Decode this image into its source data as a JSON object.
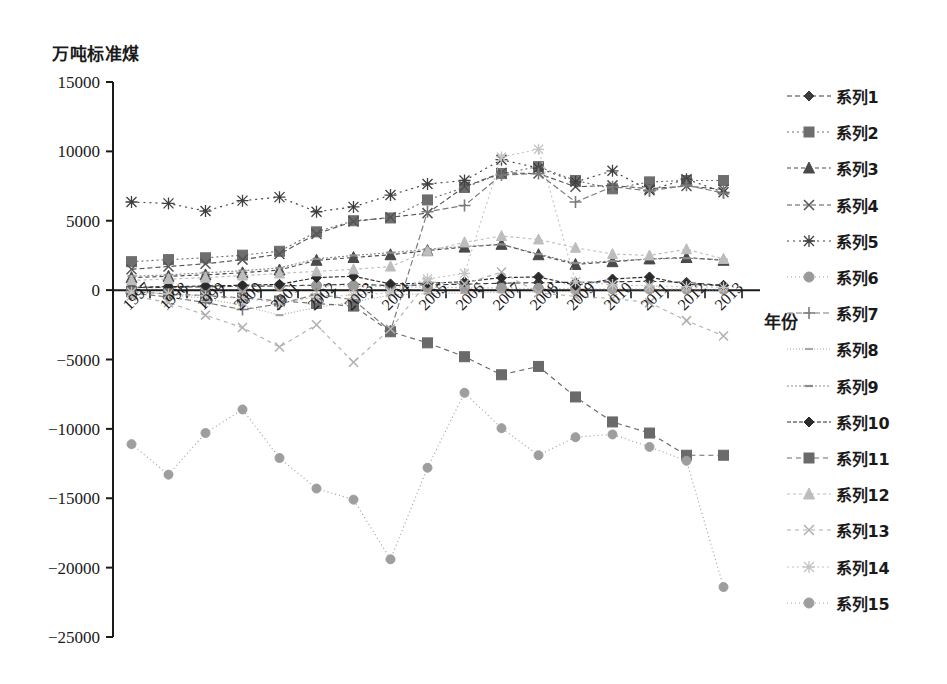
{
  "chart_data": {
    "type": "line",
    "title": "",
    "ylabel": "万吨标准煤",
    "xlabel": "年份",
    "ylim": [
      -25000,
      15000
    ],
    "ytick_step": 5000,
    "yticks": [
      "15000",
      "10000",
      "5000",
      "0",
      "-5000",
      "-10000",
      "-15000",
      "-20000",
      "-25000"
    ],
    "ytick_values": [
      15000,
      10000,
      5000,
      0,
      -5000,
      -10000,
      -15000,
      -20000,
      -25000
    ],
    "grid": false,
    "legend_position": "right",
    "categories": [
      "1997",
      "1998",
      "1999",
      "2000",
      "2001",
      "2002",
      "2003",
      "2004",
      "2005",
      "2006",
      "2007",
      "2008",
      "2009",
      "2010",
      "2011",
      "2012",
      "2013"
    ],
    "series": [
      {
        "name": "系列1",
        "marker": "diamond",
        "color": "#3c3c3c",
        "dash": "5,3",
        "values": [
          180,
          210,
          240,
          270,
          300,
          360,
          430,
          330,
          380,
          430,
          500,
          540,
          560,
          600,
          640,
          560,
          330
        ]
      },
      {
        "name": "系列2",
        "marker": "square",
        "color": "#6e6e6e",
        "dash": "2,3",
        "values": [
          2050,
          2200,
          2330,
          2520,
          2800,
          4200,
          5000,
          5200,
          6500,
          7400,
          8400,
          8900,
          7900,
          7300,
          7800,
          7900,
          7900
        ]
      },
      {
        "name": "系列3",
        "marker": "triangle",
        "color": "#4a4a4a",
        "dash": "4,3",
        "values": [
          900,
          1000,
          1100,
          1250,
          1450,
          2150,
          2350,
          2550,
          2850,
          3100,
          3300,
          2550,
          1850,
          2050,
          2250,
          2350,
          2150
        ]
      },
      {
        "name": "系列4",
        "marker": "x",
        "color": "#555555",
        "dash": "5,3",
        "values": [
          1500,
          1700,
          1900,
          2200,
          2600,
          4050,
          4950,
          5250,
          5550,
          7450,
          8450,
          8400,
          7450,
          7550,
          7300,
          7500,
          7250
        ]
      },
      {
        "name": "系列5",
        "marker": "asterisk",
        "color": "#404040",
        "dash": "2,4",
        "values": [
          6350,
          6250,
          5700,
          6450,
          6700,
          5650,
          6000,
          6850,
          7650,
          7900,
          9400,
          8800,
          7800,
          8600,
          7200,
          8000,
          7050
        ]
      },
      {
        "name": "系列6",
        "marker": "circle",
        "color": "#9a9a9a",
        "dash": "1,3",
        "values": [
          150,
          180,
          220,
          260,
          300,
          330,
          300,
          250,
          200,
          180,
          150,
          120,
          100,
          90,
          80,
          70,
          60
        ]
      },
      {
        "name": "系列7",
        "marker": "plus",
        "color": "#7a7a7a",
        "dash": "6,3",
        "values": [
          -200,
          -500,
          -900,
          -1400,
          -1000,
          -300,
          -700,
          -2950,
          5650,
          6100,
          8300,
          8400,
          6350,
          7450,
          7150,
          7550,
          7000
        ]
      },
      {
        "name": "系列8",
        "marker": "dash",
        "color": "#a8a8a8",
        "dash": "1,2",
        "values": [
          -100,
          -300,
          -600,
          -1100,
          -1800,
          -1250,
          -850,
          -350,
          -250,
          -200,
          -150,
          -120,
          -100,
          -90,
          -80,
          -70,
          -60
        ]
      },
      {
        "name": "系列9",
        "marker": "dash",
        "color": "#8a8a8a",
        "dash": "2,2",
        "values": [
          1000,
          1100,
          1250,
          1400,
          1600,
          2250,
          2500,
          2700,
          2950,
          3150,
          3300,
          2600,
          1950,
          2100,
          2250,
          2300,
          2200
        ]
      },
      {
        "name": "系列10",
        "marker": "diamond",
        "color": "#2b2b2b",
        "dash": "4,2",
        "values": [
          200,
          250,
          300,
          350,
          420,
          900,
          1000,
          450,
          500,
          600,
          900,
          950,
          350,
          800,
          950,
          400,
          350
        ]
      },
      {
        "name": "系列11",
        "marker": "square",
        "color": "#6a6a6a",
        "dash": "5,4",
        "values": [
          -120,
          -260,
          -400,
          -560,
          -780,
          -960,
          -1150,
          -3000,
          -3800,
          -4800,
          -6100,
          -5500,
          -7700,
          -9500,
          -10300,
          -11900,
          -11900
        ]
      },
      {
        "name": "系列12",
        "marker": "triangle",
        "color": "#bdbdbd",
        "dash": "3,3",
        "values": [
          700,
          800,
          900,
          1050,
          1200,
          1350,
          1500,
          1700,
          2800,
          3450,
          3900,
          3650,
          3050,
          2600,
          2500,
          2950,
          2250
        ]
      },
      {
        "name": "系列13",
        "marker": "x",
        "color": "#b0b0b0",
        "dash": "4,4",
        "values": [
          -400,
          -900,
          -1800,
          -2700,
          -4100,
          -2500,
          -5200,
          -2800,
          600,
          450,
          1300,
          -200,
          -450,
          -600,
          -900,
          -2200,
          -3300
        ]
      },
      {
        "name": "系列14",
        "marker": "asterisk",
        "color": "#c4c4c4",
        "dash": "2,3",
        "values": [
          -150,
          -280,
          -420,
          -600,
          -900,
          -500,
          -350,
          -200,
          800,
          1200,
          9600,
          10150,
          600,
          400,
          300,
          250,
          200
        ]
      },
      {
        "name": "系列15",
        "marker": "circle",
        "color": "#9e9e9e",
        "dash": "1,3",
        "values": [
          -11100,
          -13300,
          -10300,
          -8600,
          -12100,
          -14300,
          -15100,
          -19400,
          -12800,
          -7400,
          -9950,
          -11900,
          -10600,
          -10400,
          -11300,
          -12300,
          -21400
        ]
      }
    ]
  },
  "legend": {
    "items": [
      {
        "label": "系列1"
      },
      {
        "label": "系列2"
      },
      {
        "label": "系列3"
      },
      {
        "label": "系列4"
      },
      {
        "label": "系列5"
      },
      {
        "label": "系列6"
      },
      {
        "label": "系列7"
      },
      {
        "label": "系列8"
      },
      {
        "label": "系列9"
      },
      {
        "label": "系列10"
      },
      {
        "label": "系列11"
      },
      {
        "label": "系列12"
      },
      {
        "label": "系列13"
      },
      {
        "label": "系列14"
      },
      {
        "label": "系列15"
      }
    ]
  },
  "axis": {
    "y_unit_caption": "万吨标准煤",
    "x_axis_title": "年份"
  }
}
